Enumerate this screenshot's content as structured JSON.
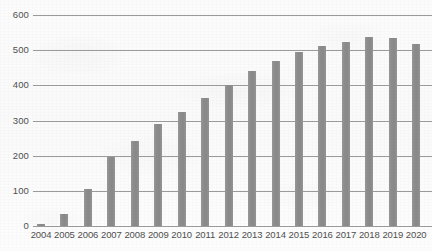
{
  "chart_data": {
    "type": "bar",
    "title": "",
    "subtitle": "",
    "xlabel": "",
    "ylabel": "",
    "categories": [
      "2004",
      "2005",
      "2006",
      "2007",
      "2008",
      "2009",
      "2010",
      "2011",
      "2012",
      "2013",
      "2014",
      "2015",
      "2016",
      "2017",
      "2018",
      "2019",
      "2020"
    ],
    "values": [
      5,
      33,
      105,
      197,
      243,
      290,
      325,
      365,
      400,
      440,
      470,
      495,
      513,
      522,
      537,
      535,
      518
    ],
    "series": [
      {
        "name": "",
        "values": [
          5,
          33,
          105,
          197,
          243,
          290,
          325,
          365,
          400,
          440,
          470,
          495,
          513,
          522,
          537,
          535,
          518
        ]
      }
    ],
    "ylim": [
      0,
      600
    ],
    "y_ticks": [
      0,
      100,
      200,
      300,
      400,
      500,
      600
    ],
    "y_tick_labels": [
      "0",
      "100",
      "200",
      "300",
      "400",
      "500",
      "600"
    ],
    "grid": true,
    "grid_axis": "y",
    "legend": false,
    "legend_position": "none",
    "bar_color": "#8e8e8e",
    "gridline_color": "#9a9a9a",
    "background_color": "#fcfcfc",
    "text_color": "#4f4f4f",
    "annotations": []
  }
}
